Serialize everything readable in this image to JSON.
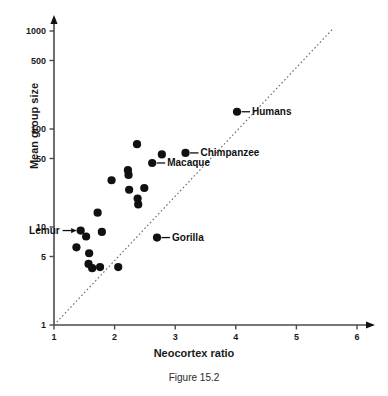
{
  "figure": {
    "caption": "Figure 15.2"
  },
  "chart_data": {
    "type": "scatter",
    "title": "",
    "xlabel": "Neocortex ratio",
    "ylabel": "Mean group size",
    "xlim": [
      1,
      6
    ],
    "ylim": [
      1,
      1000
    ],
    "yscale": "log",
    "xscale": "linear",
    "grid": false,
    "legend": "none",
    "xticks": [
      1,
      2,
      3,
      4,
      5,
      6
    ],
    "xtick_labels": [
      "1",
      "2",
      "3",
      "4",
      "5",
      "6"
    ],
    "yticks": [
      1,
      5,
      10,
      50,
      100,
      500,
      1000
    ],
    "ytick_labels": [
      "1",
      "5",
      "10",
      "50",
      "100",
      "500",
      "1000"
    ],
    "trendline": {
      "style": "dotted",
      "x0": 1.0,
      "y0": 1.0,
      "x1": 5.6,
      "y1": 1050
    },
    "points": [
      {
        "x": 1.37,
        "y": 6.2,
        "label": ""
      },
      {
        "x": 1.44,
        "y": 9.2,
        "label": "Lemur"
      },
      {
        "x": 1.53,
        "y": 8.0,
        "label": ""
      },
      {
        "x": 1.58,
        "y": 5.4,
        "label": ""
      },
      {
        "x": 1.57,
        "y": 4.2,
        "label": ""
      },
      {
        "x": 1.63,
        "y": 3.8,
        "label": ""
      },
      {
        "x": 1.72,
        "y": 14.0,
        "label": ""
      },
      {
        "x": 1.76,
        "y": 3.9,
        "label": ""
      },
      {
        "x": 1.79,
        "y": 8.9,
        "label": ""
      },
      {
        "x": 1.95,
        "y": 30.0,
        "label": ""
      },
      {
        "x": 2.06,
        "y": 3.9,
        "label": ""
      },
      {
        "x": 2.22,
        "y": 38.0,
        "label": ""
      },
      {
        "x": 2.23,
        "y": 34.0,
        "label": ""
      },
      {
        "x": 2.24,
        "y": 24.0,
        "label": ""
      },
      {
        "x": 2.37,
        "y": 70.0,
        "label": ""
      },
      {
        "x": 2.38,
        "y": 19.5,
        "label": ""
      },
      {
        "x": 2.39,
        "y": 17.0,
        "label": ""
      },
      {
        "x": 2.49,
        "y": 25.0,
        "label": ""
      },
      {
        "x": 2.62,
        "y": 45.0,
        "label": "Macaque"
      },
      {
        "x": 2.7,
        "y": 7.8,
        "label": "Gorilla"
      },
      {
        "x": 2.78,
        "y": 55.0,
        "label": ""
      },
      {
        "x": 3.17,
        "y": 57.0,
        "label": "Chimpanzee"
      },
      {
        "x": 4.02,
        "y": 150.0,
        "label": "Humans"
      }
    ],
    "annotations": [
      {
        "name": "Lemur",
        "text": "Lemur",
        "point_x": 1.44,
        "point_y": 9.2,
        "side": "left"
      },
      {
        "name": "Macaque",
        "text": "Macaque",
        "point_x": 2.62,
        "point_y": 45.0,
        "side": "right"
      },
      {
        "name": "Gorilla",
        "text": "Gorilla",
        "point_x": 2.7,
        "point_y": 7.8,
        "side": "right"
      },
      {
        "name": "Chimpanzee",
        "text": "Chimpanzee",
        "point_x": 3.17,
        "point_y": 57.0,
        "side": "right"
      },
      {
        "name": "Humans",
        "text": "Humans",
        "point_x": 4.02,
        "point_y": 150.0,
        "side": "right"
      }
    ],
    "colors": {
      "marker": "#111111",
      "axis": "#4a4a4a",
      "trendline": "#666666",
      "text": "#1a1a1a",
      "background": "#ffffff"
    }
  }
}
